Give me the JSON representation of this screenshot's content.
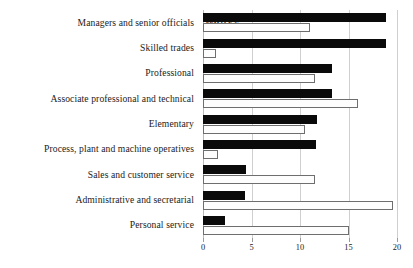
{
  "chart_data": {
    "type": "bar",
    "orientation": "horizontal",
    "title": "",
    "subtitle": "",
    "xlabel": "",
    "ylabel": "",
    "xlim": [
      0,
      20
    ],
    "xticks": [
      0,
      5,
      10,
      15,
      20
    ],
    "xtick_labels": [
      "0",
      "5",
      "10",
      "15",
      "20"
    ],
    "grid": true,
    "grid_axis": "x",
    "legend_position": "top-left-inside",
    "categories": [
      "Managers and senior officials",
      "Skilled trades",
      "Professional",
      "Associate professional and technical",
      "Elementary",
      "Process, plant and machine operatives",
      "Sales and customer service",
      "Administrative and secretarial",
      "Personal service"
    ],
    "series": [
      {
        "name": "MALE %",
        "color": "#0a0a0a",
        "values": [
          18.9,
          18.9,
          13.3,
          13.3,
          11.8,
          11.6,
          4.4,
          4.3,
          2.3
        ]
      },
      {
        "name": "FEMALE %",
        "color": "#ffffff",
        "values": [
          11.0,
          1.3,
          11.5,
          16.0,
          10.5,
          1.5,
          11.5,
          19.6,
          15.1
        ]
      }
    ]
  },
  "legend": {
    "male_label": "MALE %",
    "female_label": "FEMALE %"
  },
  "axis": {
    "ticks": [
      "0",
      "5",
      "10",
      "15",
      "20"
    ]
  },
  "colors": {
    "male_bar": "#0a0a0a",
    "female_bar": "#ffffff",
    "female_border": "#6e6e6e",
    "gridline": "#cfcfcf",
    "text": "#1b1b1b",
    "background": "#ffffff"
  }
}
